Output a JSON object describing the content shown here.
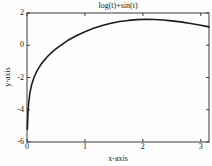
{
  "chart_data": {
    "type": "line",
    "title": "log(t)+sin(t)",
    "xlabel": "x-axis",
    "ylabel": "y-axis",
    "xlim": [
      0,
      3.1416
    ],
    "ylim": [
      -6,
      2
    ],
    "xticks": [
      0,
      1,
      2,
      3
    ],
    "yticks": [
      -6,
      -4,
      -2,
      0,
      2
    ],
    "grid": false,
    "box": true,
    "tick_direction": "in",
    "series": [
      {
        "name": "log(t)+sin(t)",
        "x": [
          0.0055,
          0.02,
          0.05,
          0.08,
          0.12,
          0.17,
          0.25,
          0.35,
          0.45,
          0.55,
          0.7,
          0.85,
          1.0,
          1.15,
          1.3,
          1.45,
          1.6,
          1.75,
          1.9,
          2.05,
          2.2,
          2.35,
          2.5,
          2.65,
          2.8,
          2.95,
          3.1,
          3.1416
        ],
        "y": [
          -5.2,
          -3.89,
          -2.95,
          -2.45,
          -2.0,
          -1.6,
          -1.14,
          -0.71,
          -0.36,
          -0.08,
          0.29,
          0.59,
          0.84,
          1.05,
          1.23,
          1.36,
          1.47,
          1.54,
          1.59,
          1.61,
          1.6,
          1.57,
          1.51,
          1.45,
          1.36,
          1.27,
          1.17,
          1.14
        ]
      }
    ],
    "colors": {
      "line": "#1c1c1c",
      "frame": "#3a3a3a",
      "text": "#222222",
      "background": "#fdfdfd"
    }
  }
}
